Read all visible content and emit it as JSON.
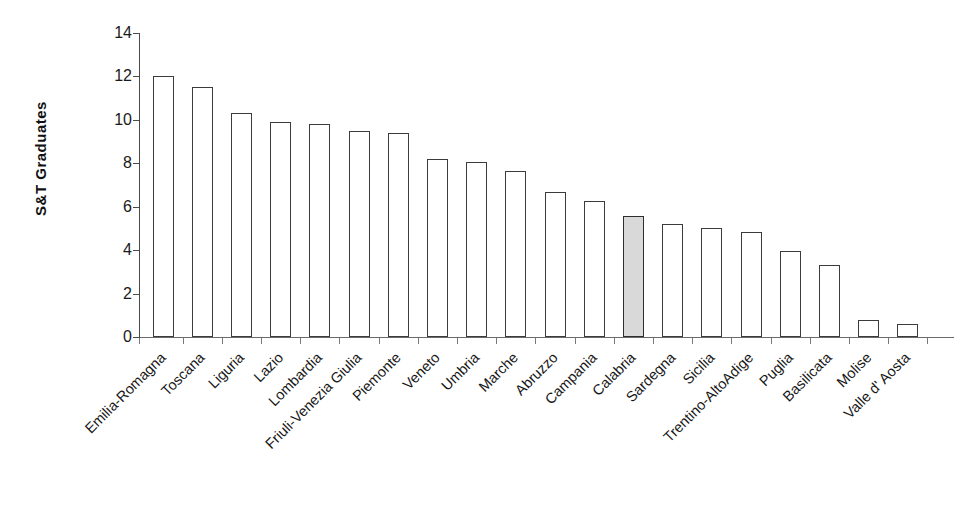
{
  "chart_data": {
    "type": "bar",
    "title": "",
    "subtitle": "",
    "xlabel": "",
    "ylabel": "S&T Graduates",
    "ylim": [
      0,
      14
    ],
    "ytick_step": 2,
    "yticks": [
      "0",
      "2",
      "4",
      "6",
      "8",
      "10",
      "12",
      "14"
    ],
    "grid": false,
    "legend": "none",
    "bar_style": {
      "default_fill": "#ffffff",
      "highlight_fill": "#d9d9d9",
      "border": "#3b3b3b"
    },
    "highlight_category": "Calabria",
    "categories": [
      "Emilia-Romagna",
      "Toscana",
      "Liguria",
      "Lazio",
      "Lombardia",
      "Friuli-Venezia Giulia",
      "Piemonte",
      "Veneto",
      "Umbria",
      "Marche",
      "Abruzzo",
      "Campania",
      "Calabria",
      "Sardegna",
      "Sicilia",
      "Trentino-AltoAdige",
      "Puglia",
      "Basilicata",
      "Molise",
      "Valle d' Aosta"
    ],
    "values": [
      12.0,
      11.5,
      10.3,
      9.9,
      9.8,
      9.5,
      9.4,
      8.2,
      8.05,
      7.65,
      6.7,
      6.25,
      5.55,
      5.2,
      5.0,
      4.85,
      3.95,
      3.3,
      0.8,
      0.6
    ],
    "highlighted": [
      false,
      false,
      false,
      false,
      false,
      false,
      false,
      false,
      false,
      false,
      false,
      false,
      true,
      false,
      false,
      false,
      false,
      false,
      false,
      false
    ]
  }
}
